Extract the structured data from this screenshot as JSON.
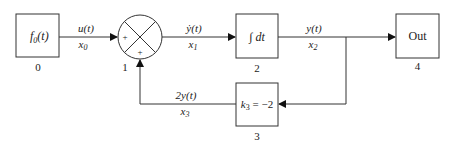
{
  "diagram": {
    "type": "block-diagram",
    "blocks": [
      {
        "id": 0,
        "label_main": "f",
        "label_sub": "0",
        "label_tail": "(t)",
        "number": "0"
      },
      {
        "id": 1,
        "kind": "summing-junction",
        "sign_left": "+",
        "sign_bottom": "+",
        "number": "1"
      },
      {
        "id": 2,
        "label": "∫ dt",
        "number": "2"
      },
      {
        "id": 3,
        "label_k": "k",
        "label_sub": "3",
        "label_tail": " = −2",
        "number": "3"
      },
      {
        "id": 4,
        "label": "Out",
        "number": "4"
      }
    ],
    "signals": [
      {
        "from": 0,
        "to": 1,
        "top": "u(t)",
        "bottom_var": "x",
        "bottom_sub": "0"
      },
      {
        "from": 1,
        "to": 2,
        "top": "ẏ(t)",
        "bottom_var": "x",
        "bottom_sub": "1"
      },
      {
        "from": 2,
        "to": 4,
        "top": "y(t)",
        "bottom_var": "x",
        "bottom_sub": "2"
      },
      {
        "from": 3,
        "to": 1,
        "top": "2y(t)",
        "bottom_var": "x",
        "bottom_sub": "3"
      }
    ]
  }
}
